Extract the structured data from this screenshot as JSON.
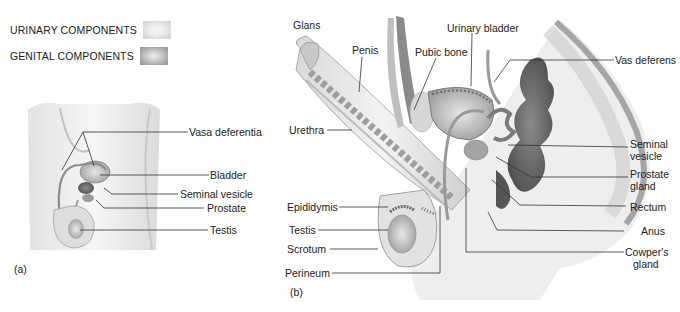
{
  "legend": {
    "items": [
      {
        "label": "URINARY COMPONENTS",
        "swatch": "#dcdcdc"
      },
      {
        "label": "GENITAL COMPONENTS",
        "swatch": "#a8a8a8"
      }
    ]
  },
  "panel_a": {
    "tag": "(a)",
    "labels": {
      "vasa_deferentia": "Vasa deferentia",
      "bladder": "Bladder",
      "seminal_vesicle": "Seminal vesicle",
      "prostate": "Prostate",
      "testis": "Testis"
    }
  },
  "panel_b": {
    "tag": "(b)",
    "labels": {
      "glans": "Glans",
      "penis": "Penis",
      "pubic_bone": "Pubic bone",
      "urinary_bladder": "Urinary bladder",
      "vas_deferens": "Vas deferens",
      "urethra": "Urethra",
      "seminal_vesicle_1": "Seminal",
      "seminal_vesicle_2": "vesicle",
      "prostate_gland_1": "Prostate",
      "prostate_gland_2": "gland",
      "rectum": "Rectum",
      "anus": "Anus",
      "cowpers_gland_1": "Cowper's",
      "cowpers_gland_2": "gland",
      "epididymis": "Epididymis",
      "testis": "Testis",
      "scrotum": "Scrotum",
      "perineum": "Perineum"
    }
  },
  "colors": {
    "ink": "#222222",
    "tissue_light": "#e4e4e4",
    "tissue_mid": "#b9b9b9",
    "tissue_dark": "#6f6f6f"
  }
}
